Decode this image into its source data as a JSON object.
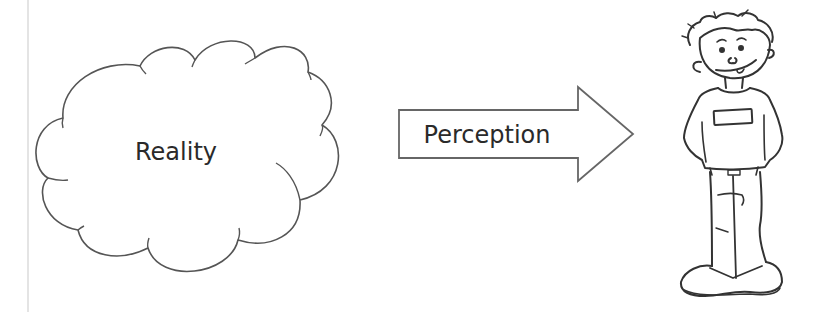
{
  "diagram": {
    "cloud": {
      "label": "Reality",
      "stroke": "#555555"
    },
    "arrow": {
      "label": "Perception",
      "stroke": "#666666"
    },
    "figure": {
      "description": "cartoon boy observer",
      "stroke": "#333333"
    },
    "colors": {
      "background": "#ffffff",
      "border": "#e4e4e4",
      "text": "#2a2a2a"
    }
  }
}
